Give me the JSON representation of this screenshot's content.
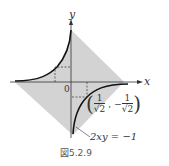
{
  "figure": {
    "caption": "図5.2.9",
    "axis_x_label": "x",
    "axis_y_label": "y",
    "origin_label": "0",
    "point_label_open": "(",
    "point_x_num": "1",
    "point_x_den": "√2",
    "point_sep": ",",
    "point_y_sign": "−",
    "point_y_num": "1",
    "point_y_den": "√2",
    "point_label_close": ")",
    "curve_label": "2xy = −1",
    "colors": {
      "shade": "#d3d3d3",
      "curve": "#111111",
      "axis": "#333333"
    }
  }
}
